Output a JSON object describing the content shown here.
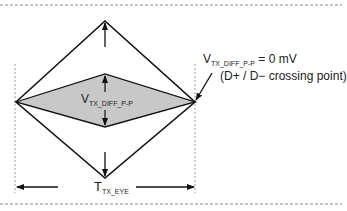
{
  "diagram": {
    "type": "eye-diagram",
    "outer_eye": {
      "label": "outer eye diamond"
    },
    "inner_eye": {
      "label": "inner shaded eye diamond",
      "fill": "#c8c8c8"
    },
    "labels": {
      "v_diff_main": "V",
      "v_diff_sub": "TX_DIFF_P-P",
      "zero_main": "V",
      "zero_sub": "TX_DIFF_P-P",
      "zero_value": " = 0 mV",
      "crossing_note": "(D+ / D− crossing point)",
      "eye_main": "T",
      "eye_sub": "TX_EYE"
    },
    "colors": {
      "line": "#111111",
      "shade": "#c8c8c8",
      "dash": "#888888"
    }
  }
}
